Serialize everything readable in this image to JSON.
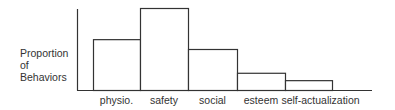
{
  "chart_data": {
    "type": "bar",
    "title": "",
    "xlabel": "",
    "ylabel": "Proportion of Behaviors",
    "ylabel_lines": [
      "Proportion",
      "of",
      "Behaviors"
    ],
    "categories": [
      "physio.",
      "safety",
      "social",
      "esteem",
      "self-actualization"
    ],
    "values": [
      62,
      100,
      50,
      21,
      12
    ],
    "ylim": [
      0,
      100
    ],
    "y_ticks": [],
    "grid": false,
    "legend": null,
    "bar_style": {
      "fill": "#ffffff",
      "stroke": "#333333"
    },
    "note": "Relative heights; no numeric axis shown"
  }
}
